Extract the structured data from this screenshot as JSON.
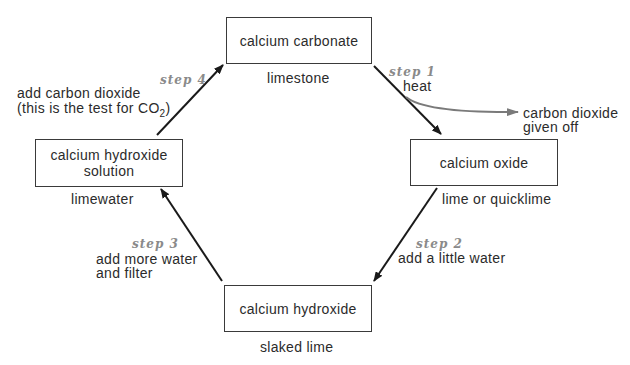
{
  "nodes": {
    "top": {
      "name": "calcium carbonate",
      "common": "limestone"
    },
    "right": {
      "name": "calcium oxide",
      "common": "lime or quicklime"
    },
    "bottom": {
      "name": "calcium hydroxide",
      "common": "slaked lime"
    },
    "left": {
      "name_line1": "calcium hydroxide",
      "name_line2": "solution",
      "common": "limewater"
    }
  },
  "steps": {
    "step1": {
      "label": "step 1",
      "action": "heat"
    },
    "step2": {
      "label": "step 2",
      "action": "add a little water"
    },
    "step3": {
      "label": "step 3",
      "action_line1": "add more water",
      "action_line2": "and filter"
    },
    "step4": {
      "label": "step 4",
      "action_line1": "add carbon dioxide",
      "action_line2_prefix": "(this is the test for CO",
      "action_line2_sub": "2",
      "action_line2_suffix": ")"
    }
  },
  "byproduct": {
    "line1": "carbon dioxide",
    "line2": "given off"
  },
  "colors": {
    "arrow": "#1a1a1a",
    "byproduct_arrow": "#7a7a7a",
    "step_text": "#8a8a8a",
    "box_border": "#3a3a3a"
  }
}
